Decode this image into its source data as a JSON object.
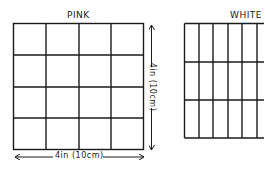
{
  "diagram": {
    "stroke_color": "#1a1a1a",
    "background": "#ffffff",
    "pink_grid": {
      "title": "PINK",
      "rows": 4,
      "cols": 4,
      "width_label": "4in (10cm)",
      "height_label": "4in (10cm)"
    },
    "white_grid": {
      "title": "WHITE",
      "rows": 3,
      "cols_visible": 6
    }
  }
}
